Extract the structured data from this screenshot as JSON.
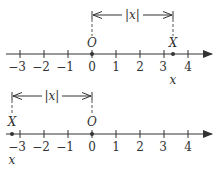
{
  "diagram": {
    "colors": {
      "ink": "#333333",
      "dash": "#555555",
      "background": "#ffffff"
    },
    "tick_values": [
      -3,
      -2,
      -1,
      0,
      1,
      2,
      3,
      4
    ],
    "tick_labels": [
      "−3",
      "−2",
      "−1",
      "0",
      "1",
      "2",
      "3",
      "4"
    ],
    "top": {
      "origin_label": "O",
      "point_label": "X",
      "point_value_label": "x",
      "distance_label": "|x|",
      "point_approx_value": 3.4
    },
    "bottom": {
      "origin_label": "O",
      "point_label": "X",
      "point_value_label": "x",
      "distance_label": "|x|",
      "point_approx_value": -3.4
    }
  }
}
